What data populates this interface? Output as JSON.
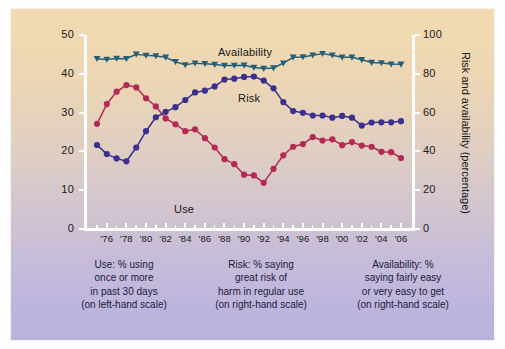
{
  "axes": {
    "left_title": "Use (percentage)",
    "right_title": "Risk and availability (percentage)",
    "left_ticks": [
      "0",
      "10",
      "20",
      "30",
      "40",
      "50"
    ],
    "right_ticks": [
      "0",
      "20",
      "40",
      "60",
      "80",
      "100"
    ],
    "x_ticks": [
      "'76",
      "'78",
      "'80",
      "'82",
      "'84",
      "'86",
      "'88",
      "'90",
      "'92",
      "'94",
      "'96",
      "'98",
      "'00",
      "'02",
      "'04",
      "'06"
    ]
  },
  "labels": {
    "availability": "Availability",
    "risk": "Risk",
    "use": "Use"
  },
  "captions": {
    "use": [
      "Use: % using",
      "once or more",
      "in past 30 days",
      "(on left-hand scale)"
    ],
    "risk": [
      "Risk: % saying",
      "great risk of",
      "harm in regular use",
      "(on right-hand scale)"
    ],
    "availability": [
      "Availability: %",
      "saying fairly easy",
      "or very easy to get",
      "(on right-hand scale)"
    ]
  },
  "colors": {
    "use": "#b52a55",
    "risk": "#3b2f8f",
    "availability": "#245f7a",
    "axis": "#ffffff",
    "bg_top": "#f2dbb0",
    "bg_bottom": "#bab2dd"
  },
  "chart_data": {
    "type": "line",
    "title": "",
    "xlabel": "",
    "ylabel": "Use (percentage)",
    "ylabel_right": "Risk and availability (percentage)",
    "ylim": [
      0,
      50
    ],
    "ylim_right": [
      0,
      100
    ],
    "grid": false,
    "legend": "inline-annotations",
    "x": [
      1975,
      1976,
      1977,
      1978,
      1979,
      1980,
      1981,
      1982,
      1983,
      1984,
      1985,
      1986,
      1987,
      1988,
      1989,
      1990,
      1991,
      1992,
      1993,
      1994,
      1995,
      1996,
      1997,
      1998,
      1999,
      2000,
      2001,
      2002,
      2003,
      2004,
      2005,
      2006
    ],
    "series": [
      {
        "name": "Use",
        "color": "#b52a55",
        "axis": "left",
        "unit": "percentage",
        "values": [
          27.1,
          32.2,
          35.4,
          37.1,
          36.5,
          33.7,
          31.6,
          28.5,
          27.0,
          25.2,
          25.7,
          23.4,
          21.0,
          18.0,
          16.7,
          14.0,
          13.8,
          11.9,
          15.5,
          19.0,
          21.2,
          21.9,
          23.7,
          22.8,
          23.1,
          21.6,
          22.4,
          21.5,
          21.2,
          19.9,
          19.8,
          18.3
        ]
      },
      {
        "name": "Risk",
        "color": "#3b2f8f",
        "axis": "right",
        "unit": "percentage",
        "values": [
          43.3,
          38.6,
          36.4,
          34.9,
          42.0,
          50.4,
          57.6,
          60.4,
          62.8,
          66.5,
          70.4,
          71.3,
          73.5,
          77.0,
          77.5,
          78.4,
          78.6,
          76.5,
          72.5,
          65.4,
          60.8,
          59.9,
          58.5,
          58.5,
          57.4,
          58.3,
          57.4,
          53.3,
          54.9,
          55.0,
          55.0,
          55.6
        ]
      },
      {
        "name": "Availability",
        "color": "#245f7a",
        "axis": "right",
        "unit": "percentage",
        "values": [
          87.8,
          87.4,
          87.9,
          87.8,
          90.1,
          89.5,
          89.2,
          88.5,
          86.2,
          84.6,
          85.5,
          85.2,
          84.8,
          84.3,
          84.3,
          84.4,
          83.3,
          82.7,
          83.0,
          85.5,
          88.5,
          88.7,
          89.6,
          90.4,
          89.6,
          88.5,
          88.5,
          87.2,
          85.8,
          85.6,
          85.0,
          84.9
        ]
      }
    ]
  }
}
